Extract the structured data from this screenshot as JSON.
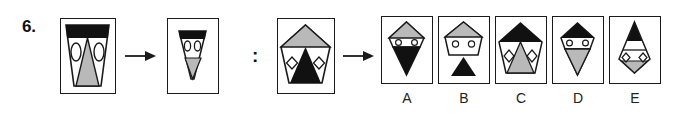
{
  "question": {
    "number": "6.",
    "type": "visual-analogy",
    "relation_separator": ":",
    "arrow_glyph": "→"
  },
  "analogy": {
    "term_a": {
      "name": "source-full-figure",
      "description": "Trapezoid with black top bar, two white ellipse eyes and a large gray triangle pointing down",
      "outline": "trapezoid",
      "top_band_color": "#111111",
      "eyes_shape": "ellipse",
      "eyes_count": 2,
      "center_triangle_color": "#b9b9b9",
      "center_triangle_direction": "down"
    },
    "term_b": {
      "name": "source-reduced-figure",
      "description": "Narrow trapezoid with black top bar, two small white circles and a small gray triangle pointing down",
      "outline": "narrow-trapezoid",
      "top_band_color": "#111111",
      "eyes_shape": "circle",
      "eyes_count": 2,
      "center_triangle_color": "#b9b9b9",
      "center_triangle_direction": "down"
    },
    "term_c": {
      "name": "target-full-figure",
      "description": "Pentagon with gray roof, two white diamonds and a large black triangle pointing up",
      "outline": "pentagon",
      "top_band_color": "#b9b9b9",
      "eyes_shape": "diamond",
      "eyes_count": 2,
      "center_triangle_color": "#111111",
      "center_triangle_direction": "up"
    }
  },
  "options": [
    {
      "label": "A",
      "name": "option-a",
      "description": "Kite outline with gray top, two small white circles, black triangle pointing down",
      "outline": "kite",
      "top_color": "#b9b9b9",
      "eyes_shape": "circle",
      "bottom_triangle_color": "#111111",
      "bottom_triangle_direction": "down"
    },
    {
      "label": "B",
      "name": "option-b",
      "description": "Pentagon with gray roof and two white circles, with a detached black triangle pointing up below",
      "outline": "pentagon",
      "top_color": "#b9b9b9",
      "eyes_shape": "circle",
      "bottom_triangle_color": "#111111",
      "bottom_triangle_direction": "up"
    },
    {
      "label": "C",
      "name": "option-c",
      "description": "Pentagon with black roof, two white diamonds and a large gray triangle pointing up",
      "outline": "pentagon",
      "top_color": "#111111",
      "eyes_shape": "diamond",
      "bottom_triangle_color": "#b9b9b9",
      "bottom_triangle_direction": "up"
    },
    {
      "label": "D",
      "name": "option-d",
      "description": "Kite outline with black top, two small white circles, gray triangle pointing down",
      "outline": "kite",
      "top_color": "#111111",
      "eyes_shape": "circle",
      "bottom_triangle_color": "#b9b9b9",
      "bottom_triangle_direction": "down"
    },
    {
      "label": "E",
      "name": "option-e",
      "description": "Kite outline with black narrow top, two small white diamonds and a gray triangle pointing down",
      "outline": "kite",
      "top_color": "#111111",
      "eyes_shape": "diamond",
      "bottom_triangle_color": "#b9b9b9",
      "bottom_triangle_direction": "down"
    }
  ],
  "colors": {
    "ink": "#1a1a1a",
    "gray_fill": "#b9b9b9",
    "black_fill": "#111111",
    "white_fill": "#ffffff",
    "background": "#ffffff"
  }
}
